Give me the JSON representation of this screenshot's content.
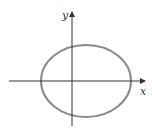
{
  "diagram": {
    "type": "ellipse-on-axes",
    "x_axis_label": "x",
    "y_axis_label": "y",
    "ellipse": {
      "cx": 86,
      "cy": 81,
      "rx": 45,
      "ry": 36,
      "stroke": "#8a8a8a"
    },
    "axis_color": "#333333"
  }
}
